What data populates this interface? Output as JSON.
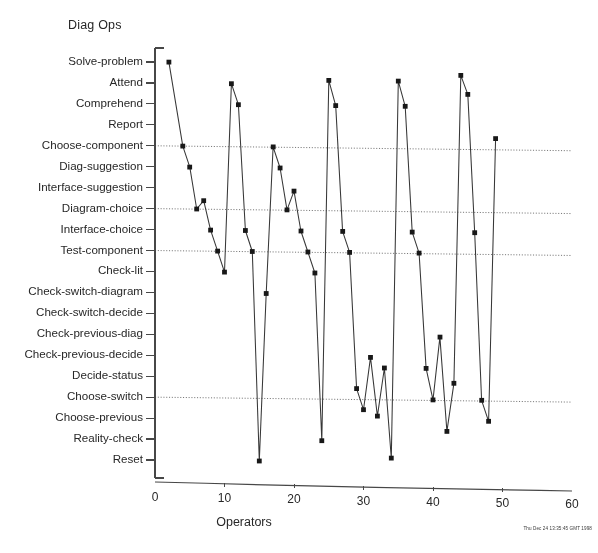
{
  "chart_data": {
    "type": "line",
    "title": "Diag Ops",
    "subtitle": "",
    "xlabel": "Operators",
    "ylabel": "Diag Ops",
    "xlim": [
      0,
      60
    ],
    "xticks": [
      0,
      10,
      20,
      30,
      40,
      50,
      60
    ],
    "xticklabels": [
      "0",
      "10",
      "20",
      "30",
      "40",
      "50",
      "60"
    ],
    "grid": "horizontal-dotted",
    "legend": "none",
    "ylim": [
      0.5,
      20.5
    ],
    "yticklabels": [
      "Solve-problem",
      "Attend",
      "Comprehend",
      "Report",
      "Choose-component",
      "Diag-suggestion",
      "Interface-suggestion",
      "Diagram-choice",
      "Interface-choice",
      "Test-component",
      "Check-lit",
      "Check-switch-diagram",
      "Check-switch-decide",
      "Check-previous-diag",
      "Check-previous-decide",
      "Decide-status",
      "Choose-switch",
      "Choose-previous",
      "Reality-check",
      "Reset"
    ],
    "ycategories_bottom_to_top": [
      "Reset",
      "Reality-check",
      "Choose-previous",
      "Choose-switch",
      "Decide-status",
      "Check-previous-decide",
      "Check-previous-diag",
      "Check-switch-decide",
      "Check-switch-diagram",
      "Check-lit",
      "Test-component",
      "Interface-choice",
      "Diagram-choice",
      "Interface-suggestion",
      "Diag-suggestion",
      "Choose-component",
      "Report",
      "Comprehend",
      "Attend",
      "Solve-problem"
    ],
    "gridline_categories": [
      "Choose-component",
      "Diagram-choice",
      "Test-component",
      "Choose-switch"
    ],
    "marker": "square",
    "line_color": "#3a3a3a",
    "series": [
      {
        "name": "diag-ops-trace",
        "x": [
          2,
          4,
          5,
          6,
          7,
          8,
          9,
          10,
          11,
          12,
          13,
          14,
          15,
          16,
          17,
          18,
          19,
          20,
          21,
          22,
          23,
          24,
          25,
          26,
          27,
          28,
          29,
          30,
          31,
          32,
          33,
          34,
          35,
          36,
          37,
          38,
          39,
          40,
          41,
          42,
          43,
          44,
          45,
          46,
          47,
          48,
          49
        ],
        "y": [
          20,
          16,
          15,
          13,
          13.4,
          12,
          11,
          10,
          19,
          18,
          12,
          11,
          1,
          9,
          16,
          15,
          13,
          13.9,
          12,
          11,
          10,
          2,
          19.2,
          18,
          12,
          11,
          4.5,
          3.5,
          6,
          3.2,
          5.5,
          1.2,
          19.2,
          18,
          12,
          11,
          5.5,
          4,
          7,
          2.5,
          4.8,
          19.5,
          18.6,
          12,
          4,
          3,
          16.5
        ]
      }
    ],
    "timestamp": "Thu Dec 24 13:35:45 GMT 1998"
  }
}
